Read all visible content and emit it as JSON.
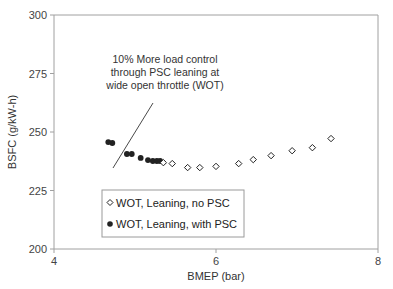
{
  "chart_data": {
    "type": "scatter",
    "title": "",
    "xlabel": "BMEP (bar)",
    "ylabel": "BSFC (g/kW-h)",
    "xlim": [
      4,
      8
    ],
    "ylim": [
      200,
      300
    ],
    "xticks": [
      4,
      6,
      8
    ],
    "yticks": [
      200,
      225,
      250,
      275,
      300
    ],
    "grid": false,
    "legend_position": "lower-left inside plot",
    "series": [
      {
        "name": "WOT, Leaning, no PSC",
        "marker": "open-diamond",
        "x": [
          5.35,
          5.46,
          5.65,
          5.8,
          6.0,
          6.28,
          6.46,
          6.68,
          6.94,
          7.19,
          7.42
        ],
        "y": [
          236.9,
          236.5,
          234.8,
          234.8,
          235.3,
          236.5,
          238.2,
          239.9,
          242.0,
          243.3,
          247.2
        ]
      },
      {
        "name": "WOT, Leaning, with PSC",
        "marker": "filled-circle",
        "x": [
          4.67,
          4.72,
          4.9,
          4.96,
          5.07,
          5.16,
          5.22,
          5.27,
          5.31
        ],
        "y": [
          245.7,
          245.3,
          240.6,
          240.6,
          238.9,
          238.0,
          237.6,
          237.6,
          237.6
        ]
      }
    ],
    "annotations": [
      {
        "text_lines": [
          "10% More load control",
          "through PSC leaning at",
          "wide open throttle (WOT)"
        ],
        "arrow_to": {
          "x": 4.72,
          "y": 245.5
        }
      }
    ]
  },
  "axes": {
    "x_title": "BMEP (bar)",
    "y_title": "BSFC (g/kW-h)",
    "x_ticks": [
      "4",
      "6",
      "8"
    ],
    "y_ticks": [
      "300",
      "275",
      "250",
      "225",
      "200"
    ]
  },
  "annotation": {
    "line1": "10% More load control",
    "line2": "through PSC leaning at",
    "line3": "wide open throttle (WOT)"
  },
  "legend": {
    "item1": "WOT, Leaning, no PSC",
    "item2": "WOT, Leaning, with PSC"
  },
  "colors": {
    "axis": "#9a9a9a",
    "marker": "#222222",
    "text": "#333333"
  }
}
